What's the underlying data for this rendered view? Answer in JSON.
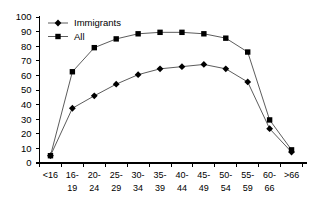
{
  "chart_data": {
    "type": "line",
    "title": "",
    "xlabel": "",
    "ylabel": "",
    "ylim": [
      0,
      100
    ],
    "ytick_step": 10,
    "grid": false,
    "legend_position": "top-left",
    "categories": [
      "<16",
      "16-19",
      "20-24",
      "25-29",
      "30-34",
      "35-39",
      "40-44",
      "45-49",
      "50-54",
      "55-59",
      "60-66",
      ">66"
    ],
    "category_lines": [
      [
        "<16",
        ""
      ],
      [
        "16-",
        "19"
      ],
      [
        "20-",
        "24"
      ],
      [
        "25-",
        "29"
      ],
      [
        "30-",
        "34"
      ],
      [
        "35-",
        "39"
      ],
      [
        "40-",
        "44"
      ],
      [
        "45-",
        "49"
      ],
      [
        "50-",
        "54"
      ],
      [
        "55-",
        "59"
      ],
      [
        "60-",
        "66"
      ],
      [
        ">66",
        ""
      ]
    ],
    "yticks": [
      0,
      10,
      20,
      30,
      40,
      50,
      60,
      70,
      80,
      90,
      100
    ],
    "series": [
      {
        "name": "Immigrants",
        "marker": "diamond",
        "color": "#000000",
        "values": [
          5,
          37.5,
          46,
          54,
          60.5,
          64.5,
          66,
          67.5,
          64.5,
          55.5,
          23.5,
          7.5
        ]
      },
      {
        "name": "All",
        "marker": "square",
        "color": "#000000",
        "values": [
          5,
          62.5,
          79,
          85,
          88.5,
          89.5,
          89.5,
          88.5,
          85.5,
          76,
          29.5,
          9
        ]
      }
    ]
  },
  "legend": {
    "items": [
      {
        "label": "Immigrants",
        "marker": "diamond"
      },
      {
        "label": "All",
        "marker": "square"
      }
    ]
  }
}
